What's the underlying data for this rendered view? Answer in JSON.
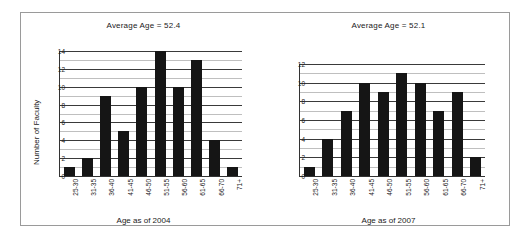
{
  "figure": {
    "border_color": "#9a9a9a",
    "background": "#ffffff",
    "bar_color": "#151515"
  },
  "charts": [
    {
      "id": "faculty-age-2004",
      "title": "Average Age = 52.4",
      "ylabel": "Number of Faculty",
      "xlabel": "Age as of 2004",
      "yticks": [
        "0",
        "2",
        "4",
        "6",
        "8",
        "10",
        "12",
        "14"
      ],
      "categories": [
        "25-30",
        "31-35",
        "36-40",
        "41-45",
        "46-50",
        "51-55",
        "56-60",
        "61-65",
        "66-70",
        "71+"
      ],
      "values": [
        1,
        2,
        9,
        5,
        10,
        14,
        10,
        13,
        4,
        1
      ]
    },
    {
      "id": "faculty-age-2007",
      "title": "Average Age = 52.1",
      "ylabel": "",
      "xlabel": "Age as of 2007",
      "yticks": [
        "0",
        "2",
        "4",
        "6",
        "8",
        "10",
        "12"
      ],
      "categories": [
        "25-30",
        "31-35",
        "36-40",
        "41-45",
        "46-50",
        "51-55",
        "56-60",
        "61-65",
        "66-70",
        "71+"
      ],
      "values": [
        1,
        4,
        7,
        10,
        9,
        11,
        10,
        7,
        9,
        2
      ]
    }
  ],
  "chart_data": [
    {
      "type": "bar",
      "title": "Average Age = 52.4",
      "xlabel": "Age as of 2004",
      "ylabel": "Number of Faculty",
      "categories": [
        "25-30",
        "31-35",
        "36-40",
        "41-45",
        "46-50",
        "51-55",
        "56-60",
        "61-65",
        "66-70",
        "71+"
      ],
      "values": [
        1,
        2,
        9,
        5,
        10,
        14,
        10,
        13,
        4,
        1
      ],
      "ylim": [
        0,
        14
      ],
      "ytick_step": 2,
      "minor_gridlines": true,
      "grid": "horizontal",
      "legend": "none",
      "bar_color": "#151515"
    },
    {
      "type": "bar",
      "title": "Average Age = 52.1",
      "xlabel": "Age as of 2007",
      "ylabel": "",
      "categories": [
        "25-30",
        "31-35",
        "36-40",
        "41-45",
        "46-50",
        "51-55",
        "56-60",
        "61-65",
        "66-70",
        "71+"
      ],
      "values": [
        1,
        4,
        7,
        10,
        9,
        11,
        10,
        7,
        9,
        2
      ],
      "ylim": [
        0,
        12
      ],
      "ytick_step": 2,
      "minor_gridlines": true,
      "grid": "horizontal",
      "legend": "none",
      "bar_color": "#151515"
    }
  ]
}
